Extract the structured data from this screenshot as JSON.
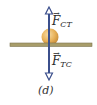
{
  "figure": {
    "caption": "(d)",
    "colors": {
      "arrow": "#3b4f8c",
      "ball": "#e8b25a",
      "ball_highlight": "#f6dca6",
      "bar": "#a89d6a",
      "bar_edge": "#7d7650"
    },
    "forces": [
      {
        "symbol": "F",
        "subscript": "CT",
        "direction": "up"
      },
      {
        "symbol": "F",
        "subscript": "TC",
        "direction": "down"
      }
    ],
    "objects": {
      "ball": "ball",
      "surface": "table-bar"
    }
  }
}
